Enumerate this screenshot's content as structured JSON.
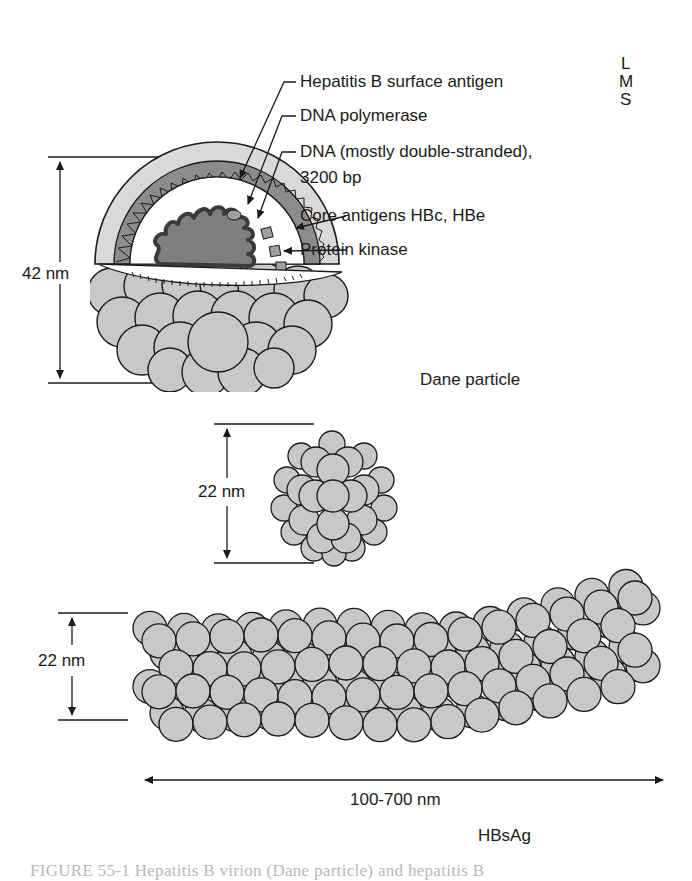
{
  "figure": {
    "caption": "FIGURE 55-1  Hepatitis B virion (Dane particle) and hepatitis B",
    "colors": {
      "outline": "#1a1a1a",
      "envelope": "#d9d9d9",
      "core_band": "#8c8c8c",
      "dna": "#7f7f7f",
      "particle": "#c8c8c8",
      "background": "#ffffff"
    }
  },
  "dane_particle": {
    "title": "Dane particle",
    "size_label": "42 nm",
    "labels": [
      {
        "text": "Hepatitis B surface antigen"
      },
      {
        "text": "DNA polymerase"
      },
      {
        "text": "DNA (mostly double-stranded),"
      },
      {
        "text": "3200 bp"
      },
      {
        "text": "Core antigens HBc, HBe"
      },
      {
        "text": "Protein kinase"
      }
    ],
    "surface_antigen_forms": [
      "L",
      "M",
      "S"
    ]
  },
  "spherical_particle": {
    "size_label": "22 nm"
  },
  "filamentous_particle": {
    "size_label": "22 nm",
    "length_label": "100-700 nm",
    "title": "HBsAg"
  }
}
